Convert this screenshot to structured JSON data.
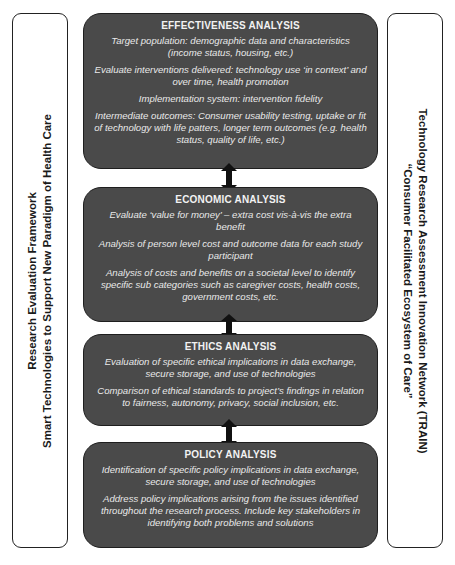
{
  "left_panel": {
    "line1": "Research Evaluation Framework",
    "line2": "Smart Technologies to Support New Paradigm of Health Care"
  },
  "right_panel": {
    "line1": "Technology Research Assessment Innovation Network (TRAIN)",
    "line2": "“Consumer Facilitated Ecosystem of Care”"
  },
  "boxes": {
    "effectiveness": {
      "title": "EFFECTIVENESS ANALYSIS",
      "items": [
        "Target population: demographic data and characteristics (income status, housing, etc.)",
        "Evaluate interventions delivered: technology use ‘in context’ and over time, health promotion",
        "Implementation system: intervention fidelity",
        "Intermediate outcomes: Consumer usability testing, uptake or fit of technology with life patters, longer term outcomes (e.g. health status, quality of life, etc.)"
      ]
    },
    "economic": {
      "title": "ECONOMIC ANALYSIS",
      "items": [
        "Evaluate ‘value for money’ – extra cost vis-à-vis the extra benefit",
        "Analysis of person level cost and outcome data for each study participant",
        "Analysis of costs and benefits on a societal level to identify specific sub categories such as caregiver costs, health costs, government costs, etc."
      ]
    },
    "ethics": {
      "title": "ETHICS ANALYSIS",
      "items": [
        "Evaluation of specific ethical implications in data exchange, secure storage, and use of technologies",
        "Comparison of ethical standards to project’s findings in relation to fairness, autonomy, privacy, social inclusion, etc."
      ]
    },
    "policy": {
      "title": "POLICY ANALYSIS",
      "items": [
        "Identification of specific policy implications in data exchange, secure storage, and use of technologies",
        "Address policy implications arising from the issues identified throughout the research process. Include key stakeholders in identifying both problems and solutions"
      ]
    }
  },
  "connectors": [
    "double-arrow",
    "double-arrow",
    "double-arrow"
  ],
  "colors": {
    "box_fill": "#4a4a4a",
    "box_border": "#1e1e1e",
    "box_text": "#e9e9e9",
    "arrow": "#111111"
  }
}
